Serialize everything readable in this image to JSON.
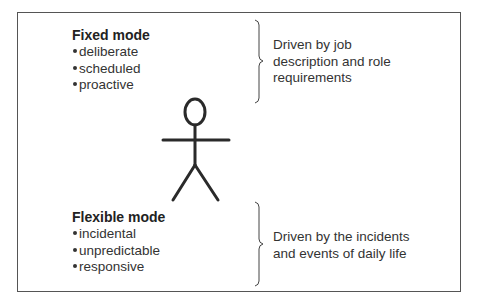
{
  "diagram": {
    "fixed_mode": {
      "title": "Fixed mode",
      "items": [
        "deliberate",
        "scheduled",
        "proactive"
      ],
      "description": [
        "Driven by job",
        "description and role",
        "requirements"
      ]
    },
    "flexible_mode": {
      "title": "Flexible mode",
      "items": [
        "incidental",
        "unpredictable",
        "responsive"
      ],
      "description": [
        "Driven by the incidents",
        "and events of daily life"
      ]
    },
    "figure": "stick-person",
    "colors": {
      "line": "#2a2a2a",
      "border": "#555555",
      "background": "#ffffff"
    }
  }
}
